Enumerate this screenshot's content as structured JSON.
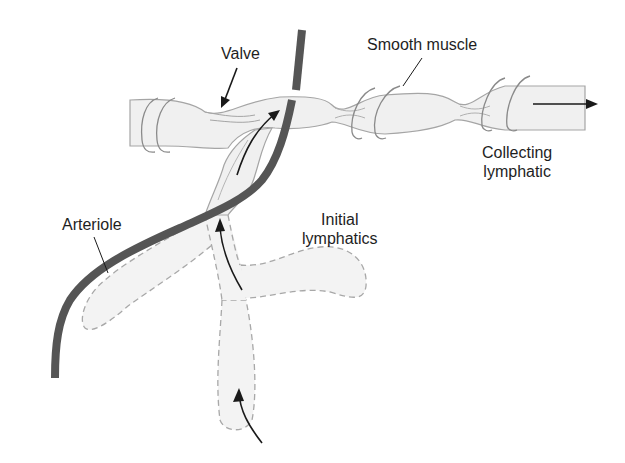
{
  "diagram": {
    "type": "anatomical-illustration",
    "labels": {
      "valve": "Valve",
      "smooth_muscle": "Smooth muscle",
      "collecting_line1": "Collecting",
      "collecting_line2": "lymphatic",
      "arteriole": "Arteriole",
      "initial_line1": "Initial",
      "initial_line2": "lymphatics"
    },
    "flow_direction": "Lymph flows from initial lymphatics upward through valves into collecting lymphatic, then rightward",
    "colors": {
      "arteriole": "#555555",
      "vessel_fill": "#f1f1f1",
      "vessel_outline": "#9a9a9a",
      "arrow": "#1a1a1a",
      "text": "#1e1e1e"
    }
  }
}
